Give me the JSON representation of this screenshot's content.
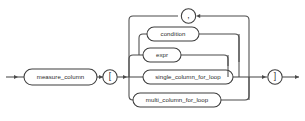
{
  "diagram": {
    "kind": "railroad-syntax-diagram",
    "name": "measure_column-subscript-syntax",
    "background_color": "#ffffff",
    "line_color": "#4a4a4a",
    "text_color": "#2b2b2b",
    "entry_label": "",
    "exit_label": "",
    "nodes": {
      "measure_column": {
        "label": "measure_column",
        "shape": "rounded-box",
        "type": "nonterminal"
      },
      "open_bracket": {
        "label": "[",
        "shape": "circle",
        "type": "terminal"
      },
      "close_bracket": {
        "label": "]",
        "shape": "circle",
        "type": "terminal"
      },
      "comma": {
        "label": ",",
        "shape": "circle",
        "type": "terminal"
      },
      "condition": {
        "label": "condition",
        "shape": "rounded-box",
        "type": "nonterminal"
      },
      "expr": {
        "label": "expr",
        "shape": "rounded-box",
        "type": "nonterminal"
      },
      "single_column_for_loop": {
        "label": "single_column_for_loop",
        "shape": "rounded-box",
        "type": "nonterminal"
      },
      "multi_column_for_loop": {
        "label": "multi_column_for_loop",
        "shape": "rounded-box",
        "type": "nonterminal"
      }
    },
    "alternatives": [
      "condition",
      "expr",
      "single_column_for_loop",
      "multi_column_for_loop"
    ],
    "loop": {
      "separator": "comma",
      "direction": "right-to-left"
    }
  }
}
